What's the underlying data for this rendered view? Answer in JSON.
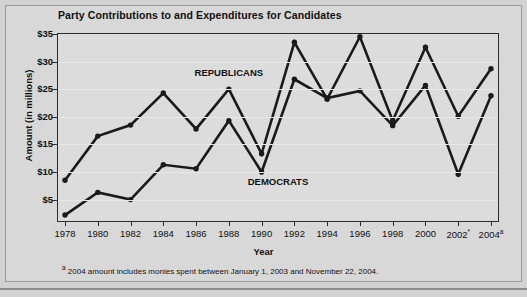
{
  "chart_data": {
    "type": "line",
    "title": "Party Contributions to and Expenditures for Candidates",
    "xlabel": "Year",
    "ylabel": "Amount (in millions)",
    "ylim": [
      0,
      35
    ],
    "ytick_values": [
      5,
      10,
      15,
      20,
      25,
      30,
      35
    ],
    "ytick_labels": [
      "$5",
      "$10",
      "$15",
      "$20",
      "$25",
      "$30",
      "$35"
    ],
    "grid": true,
    "grid_axis": "y",
    "legend_position": "inline-annotations",
    "categories": [
      1978,
      1980,
      1982,
      1984,
      1986,
      1988,
      1990,
      1992,
      1994,
      1996,
      1998,
      2000,
      2002,
      2004
    ],
    "xtick_labels": [
      "1978",
      "1980",
      "1982",
      "1984",
      "1986",
      "1988",
      "1990",
      "1992",
      "1994",
      "1996",
      "1998",
      "2000",
      "2002",
      "2004"
    ],
    "xtick_superscripts": [
      "",
      "",
      "",
      "",
      "",
      "",
      "",
      "",
      "",
      "",
      "",
      "",
      "*",
      "a"
    ],
    "series": [
      {
        "name": "REPUBLICANS",
        "color": "#1a1a1a",
        "values": [
          8.5,
          16.5,
          18.5,
          24.3,
          17.8,
          25.0,
          13.3,
          33.5,
          23.2,
          34.5,
          19.3,
          32.6,
          20.1,
          28.7
        ],
        "annotation": "REPUBLICANS",
        "annotation_x": 1988,
        "annotation_y": 27.9
      },
      {
        "name": "DEMOCRATS",
        "color": "#1a1a1a",
        "values": [
          2.2,
          6.3,
          5.0,
          11.3,
          10.6,
          19.3,
          10.0,
          26.8,
          23.4,
          24.7,
          18.4,
          25.7,
          9.6,
          23.8
        ],
        "annotation": "DEMOCRATS",
        "annotation_x": 1991,
        "annotation_y": 8.2
      }
    ],
    "footnote": "2004 amount includes monies spent between January 1, 2003 and November 22, 2004.",
    "footnote_marker": "a"
  },
  "colors": {
    "page_background": "#d2d2d2",
    "panel_background": "#d8d8d8",
    "plot_background": "#dcdcdc",
    "axis": "#2c2c2c",
    "gridline": "#e8e8e8",
    "line": "#1a1a1a",
    "text": "#111111"
  }
}
